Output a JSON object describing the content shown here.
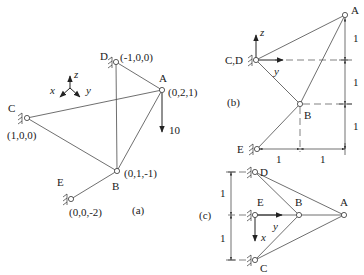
{
  "figure": {
    "panel_a": {
      "caption": "(a)",
      "nodes": [
        {
          "id": "A",
          "label": "A",
          "coords": "(0,2,1)"
        },
        {
          "id": "B",
          "label": "B",
          "coords": "(0,1,-1)"
        },
        {
          "id": "C",
          "label": "C",
          "coords": "(1,0,0)"
        },
        {
          "id": "D",
          "label": "D",
          "coords": "(-1,0,0)"
        },
        {
          "id": "E",
          "label": "E",
          "coords": "(0,0,-2)"
        }
      ],
      "load": {
        "value": "10",
        "at": "A",
        "direction": "down"
      },
      "axes": {
        "x": "x",
        "y": "y",
        "z": "z"
      }
    },
    "panel_b": {
      "caption": "(b)",
      "labels": {
        "A": "A",
        "CD": "C,D",
        "B": "B",
        "E": "E"
      },
      "axes": {
        "y": "y",
        "z": "z"
      },
      "vertical_dims": [
        "1",
        "1",
        "1"
      ],
      "horizontal_dims": [
        "1",
        "1"
      ]
    },
    "panel_c": {
      "caption": "(c)",
      "labels": {
        "A": "A",
        "B": "B",
        "C": "C",
        "D": "D",
        "E": "E"
      },
      "axes": {
        "x": "x",
        "y": "y"
      },
      "vertical_dims": [
        "1",
        "1"
      ]
    }
  }
}
